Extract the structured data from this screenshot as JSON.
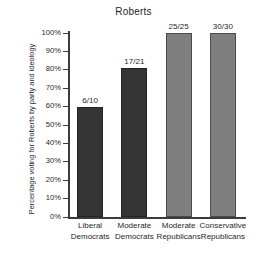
{
  "chart_data": {
    "type": "bar",
    "title": "Roberts",
    "xlabel": "",
    "ylabel": "Percentage voting for Roberts by party and ideology",
    "ylim": [
      0,
      100
    ],
    "grid": false,
    "legend": "none",
    "categories": [
      "Liberal Democrats",
      "Moderate Democrats",
      "Moderate Republicans",
      "Conservative Republicans"
    ],
    "category_lines": [
      [
        "Liberal",
        "Democrats"
      ],
      [
        "Moderate",
        "Democrats"
      ],
      [
        "Moderate",
        "Republicans"
      ],
      [
        "Conservative",
        "Republicans"
      ]
    ],
    "values": [
      60,
      81,
      100,
      100
    ],
    "point_labels": [
      "6/10",
      "17/21",
      "25/25",
      "30/30"
    ],
    "numerators": [
      6,
      17,
      25,
      30
    ],
    "denominators": [
      10,
      21,
      25,
      30
    ],
    "tick_labels": [
      "100%",
      "90%",
      "80%",
      "70%",
      "60%",
      "50%",
      "40%",
      "30%",
      "20%",
      "10%",
      "0%"
    ],
    "tick_values": [
      100,
      90,
      80,
      70,
      60,
      50,
      40,
      30,
      20,
      10,
      0
    ],
    "bar_colors": [
      "#343434",
      "#343434",
      "#7f7f7f",
      "#7f7f7f"
    ],
    "group_colors": {
      "democrats": "#343434",
      "republicans": "#7f7f7f"
    }
  }
}
